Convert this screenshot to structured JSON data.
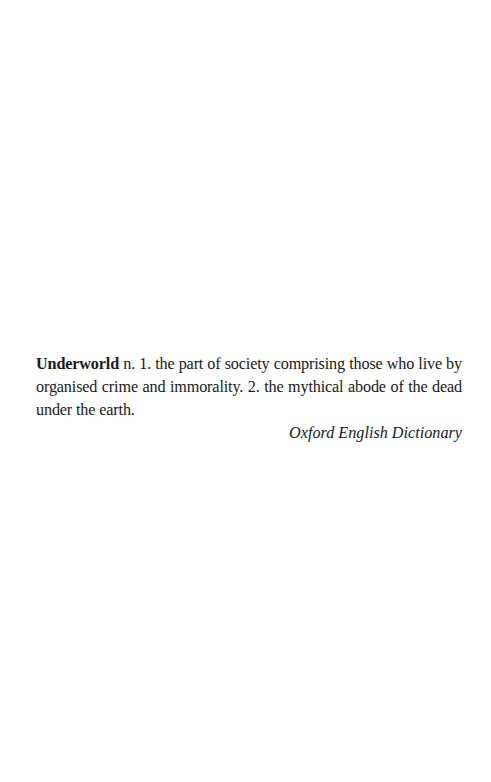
{
  "epigraph": {
    "term": "Underworld",
    "definition": " n. 1. the part of society comprising those who live by organised crime and immorality. 2. the mythical abode of the dead under the earth.",
    "source": "Oxford English Dictionary"
  }
}
